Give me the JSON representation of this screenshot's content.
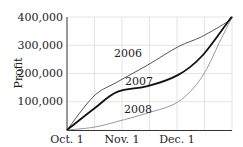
{
  "chart_data": {
    "type": "line",
    "title": "",
    "xlabel": "",
    "ylabel": "Profit",
    "x_ticks": [
      "Oct. 1",
      "Nov. 1",
      "Dec. 1"
    ],
    "y_ticks": [
      "100,000",
      "200,000",
      "300,000",
      "400,000"
    ],
    "ylim": [
      0,
      400000
    ],
    "xlim_days": [
      0,
      92
    ],
    "grid": true,
    "legend": "inline labels",
    "series": [
      {
        "name": "2006",
        "color": "#555555",
        "width": 1,
        "points": [
          [
            0,
            0
          ],
          [
            15,
            120000
          ],
          [
            28,
            170000
          ],
          [
            45,
            230000
          ],
          [
            62,
            295000
          ],
          [
            75,
            330000
          ],
          [
            90,
            385000
          ],
          [
            92,
            400000
          ]
        ]
      },
      {
        "name": "2007",
        "color": "#111111",
        "width": 1.8,
        "points": [
          [
            0,
            0
          ],
          [
            15,
            75000
          ],
          [
            28,
            135000
          ],
          [
            45,
            155000
          ],
          [
            62,
            195000
          ],
          [
            75,
            260000
          ],
          [
            90,
            385000
          ],
          [
            92,
            400000
          ]
        ]
      },
      {
        "name": "2008",
        "color": "#999999",
        "width": 1,
        "points": [
          [
            0,
            0
          ],
          [
            15,
            10000
          ],
          [
            28,
            30000
          ],
          [
            45,
            60000
          ],
          [
            62,
            100000
          ],
          [
            75,
            185000
          ],
          [
            85,
            310000
          ],
          [
            92,
            400000
          ]
        ]
      }
    ]
  },
  "labels": {
    "ylabel": "Profit",
    "s2006": "2006",
    "s2007": "2007",
    "s2008": "2008",
    "x0": "Oct. 1",
    "x1": "Nov. 1",
    "x2": "Dec. 1",
    "y1": "100,000",
    "y2": "200,000",
    "y3": "300,000",
    "y4": "400,000"
  }
}
